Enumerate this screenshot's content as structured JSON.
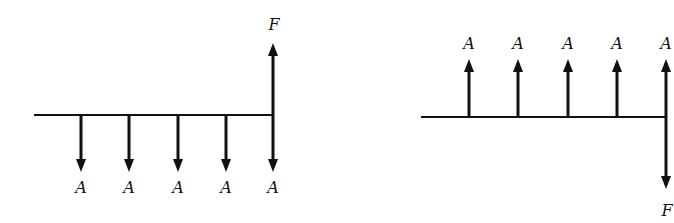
{
  "diagrams": [
    {
      "name": "left-cash-flow",
      "axis": {
        "x1": 34,
        "x2": 273,
        "y": 115
      },
      "payments": [
        {
          "x": 81,
          "label": "A"
        },
        {
          "x": 129,
          "label": "A"
        },
        {
          "x": 178,
          "label": "A"
        },
        {
          "x": 226,
          "label": "A"
        },
        {
          "x": 273,
          "label": "A"
        }
      ],
      "payment_direction": "down",
      "payment_end_y": 172,
      "payment_label_y": 193,
      "future": {
        "x": 273,
        "label": "F",
        "direction": "up",
        "end_y": 43,
        "label_y": 30
      }
    },
    {
      "name": "right-cash-flow",
      "axis": {
        "x1": 421,
        "x2": 666,
        "y": 117
      },
      "payments": [
        {
          "x": 469,
          "label": "A"
        },
        {
          "x": 518,
          "label": "A"
        },
        {
          "x": 568,
          "label": "A"
        },
        {
          "x": 617,
          "label": "A"
        },
        {
          "x": 666,
          "label": "A"
        }
      ],
      "payment_direction": "up",
      "payment_end_y": 59,
      "payment_label_y": 49,
      "future": {
        "x": 666,
        "label": "F",
        "direction": "down",
        "end_y": 189,
        "label_y": 216
      }
    }
  ]
}
